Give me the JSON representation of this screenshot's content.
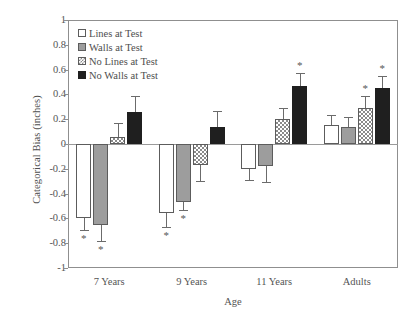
{
  "chart_data": {
    "type": "bar",
    "title": "",
    "xlabel": "Age",
    "ylabel": "Categorical Bias (inches)",
    "ylim": [
      -1,
      1
    ],
    "ytick_labels": [
      "1",
      "0.8",
      "0.6",
      "0.4",
      "0.2",
      "0",
      "-0.2",
      "-0.4",
      "-0.6",
      "-0.8",
      "-1"
    ],
    "ytick_values": [
      1,
      0.8,
      0.6,
      0.4,
      0.2,
      0,
      -0.2,
      -0.4,
      -0.6,
      -0.8,
      -1
    ],
    "grid": false,
    "legend_position": "top-left",
    "categories": [
      "7 Years",
      "9 Years",
      "11 Years",
      "Adults"
    ],
    "series": [
      {
        "name": "Lines at Test",
        "fill": "white",
        "values": [
          -0.6,
          -0.56,
          -0.2,
          0.15
        ],
        "errors": [
          0.09,
          0.11,
          0.09,
          0.08
        ],
        "significant": [
          true,
          true,
          false,
          false
        ]
      },
      {
        "name": "Walls at Test",
        "fill": "gray",
        "values": [
          -0.65,
          -0.47,
          -0.18,
          0.14
        ],
        "errors": [
          0.13,
          0.06,
          0.13,
          0.08
        ],
        "significant": [
          true,
          true,
          false,
          false
        ]
      },
      {
        "name": "No Lines at Test",
        "fill": "hatch",
        "values": [
          0.06,
          -0.17,
          0.2,
          0.29
        ],
        "errors": [
          0.11,
          0.13,
          0.09,
          0.1
        ],
        "significant": [
          false,
          false,
          false,
          true
        ]
      },
      {
        "name": "No Walls at Test",
        "fill": "black",
        "values": [
          0.26,
          0.14,
          0.47,
          0.45
        ],
        "errors": [
          0.13,
          0.13,
          0.1,
          0.1
        ],
        "significant": [
          false,
          false,
          true,
          true
        ]
      }
    ],
    "significance_marker": "*"
  }
}
